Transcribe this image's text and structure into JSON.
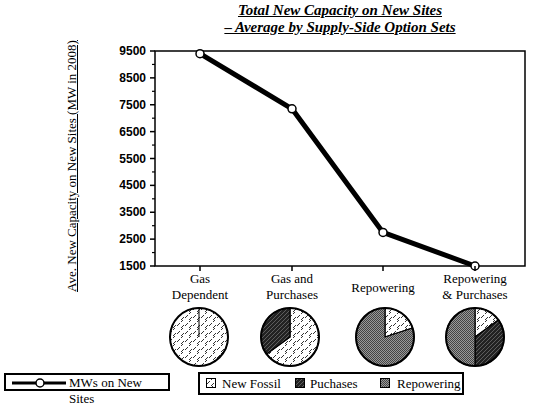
{
  "chart_data": {
    "type": "line",
    "title": "Total New Capacity on New Sites",
    "subtitle": "– Average by Supply-Side Option Sets",
    "xlabel": "",
    "ylabel": "Ave. New Capacity on New Sites (MW in 2008)",
    "categories": [
      "Gas Dependent",
      "Gas and Purchases",
      "Repowering",
      "Repowering & Purchases"
    ],
    "series": [
      {
        "name": "MWs on New Sites",
        "values": [
          9400,
          7350,
          2750,
          1450
        ]
      }
    ],
    "ylim": [
      1500,
      9500
    ],
    "yticks": [
      9500,
      8500,
      7500,
      6500,
      5500,
      4500,
      3500,
      2500,
      1500
    ],
    "grid": false,
    "pies": {
      "legend": [
        "New Fossil",
        "Puchases",
        "Repowering"
      ],
      "shares": [
        {
          "category": "Gas Dependent",
          "New Fossil": 100,
          "Puchases": 0,
          "Repowering": 0
        },
        {
          "category": "Gas and Purchases",
          "New Fossil": 65,
          "Puchases": 35,
          "Repowering": 0
        },
        {
          "category": "Repowering",
          "New Fossil": 20,
          "Puchases": 0,
          "Repowering": 80
        },
        {
          "category": "Repowering & Purchases",
          "New Fossil": 15,
          "Puchases": 35,
          "Repowering": 50
        }
      ]
    }
  },
  "title_line1": "Total New Capacity on New Sites",
  "title_line2": "– Average by Supply-Side Option Sets",
  "ylabel": "Ave. New Capacity on New Sites (MW in 2008)",
  "xcats": [
    {
      "line1": "Gas",
      "line2": "Dependent"
    },
    {
      "line1": "Gas and",
      "line2": "Purchases"
    },
    {
      "line1": "Repowering",
      "line2": ""
    },
    {
      "line1": "Repowering",
      "line2": "& Purchases"
    }
  ],
  "legend_line": "MWs on New Sites",
  "legend_pie": {
    "fossil": "New Fossil",
    "purchases": "Puchases",
    "repowering": "Repowering"
  }
}
